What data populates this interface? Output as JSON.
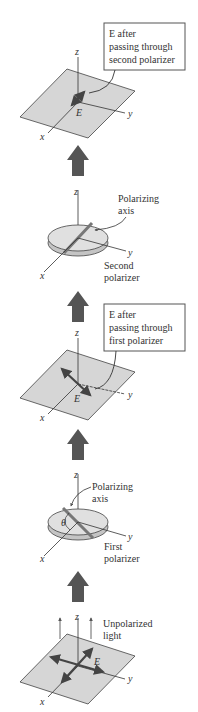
{
  "diagram": {
    "type": "polarizer-sequence",
    "stages": [
      {
        "id": "after-second",
        "axes": {
          "x": "x",
          "y": "y",
          "z": "z"
        },
        "vector_label": "E",
        "callout": [
          "E after",
          "passing through",
          "second polarizer"
        ]
      },
      {
        "id": "second-polarizer",
        "axes": {
          "x": "x",
          "y": "y",
          "z": "z"
        },
        "axis_label": [
          "Polarizing",
          "axis"
        ],
        "name": [
          "Second",
          "polarizer"
        ]
      },
      {
        "id": "after-first",
        "axes": {
          "x": "x",
          "y": "y",
          "z": "z"
        },
        "vector_label": "E",
        "callout": [
          "E after",
          "passing through",
          "first polarizer"
        ]
      },
      {
        "id": "first-polarizer",
        "axes": {
          "x": "x",
          "y": "y",
          "z": "z"
        },
        "axis_label": [
          "Polarizing",
          "axis"
        ],
        "angle_label": "θ",
        "name": [
          "First",
          "polarizer"
        ]
      },
      {
        "id": "unpolarized",
        "axes": {
          "x": "x",
          "y": "y",
          "z": "z"
        },
        "vector_label": "E",
        "label": [
          "Unpolarized",
          "light"
        ]
      }
    ],
    "colors": {
      "plane_fill": "#d6d6d6",
      "big_arrow": "#555555",
      "vector": "#444444",
      "line": "#333333"
    }
  }
}
